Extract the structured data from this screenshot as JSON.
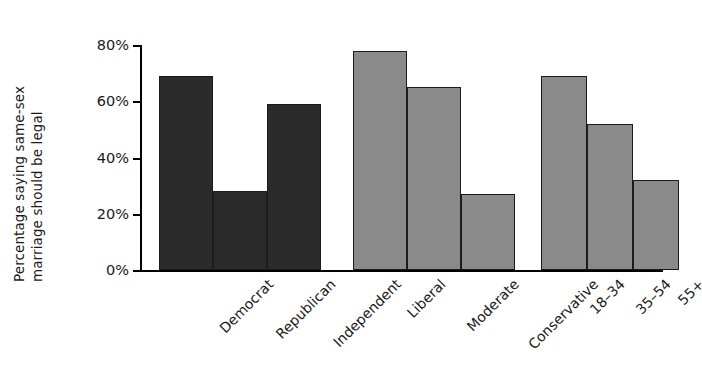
{
  "chart_data": {
    "type": "bar",
    "title": "",
    "subtitle": "",
    "xlabel": "",
    "ylabel": "Percentage saying same-sex marriage should be legal",
    "ylabel_line1": "Percentage saying same-sex",
    "ylabel_line2": "marriage should be legal",
    "ylim": [
      0,
      80
    ],
    "ytick_values": [
      0,
      20,
      40,
      60,
      80
    ],
    "ytick_labels": [
      "0%",
      "20%",
      "40%",
      "60%",
      "80%"
    ],
    "grid": false,
    "legend": false,
    "legend_position": "none",
    "categories": [
      "Democrat",
      "Republican",
      "Independent",
      "Liberal",
      "Moderate",
      "Conservative",
      "18–34",
      "35–54",
      "55+"
    ],
    "values": [
      69,
      28,
      59,
      78,
      65,
      27,
      69,
      52,
      32
    ],
    "groups": [
      {
        "name": "Party",
        "color": "#2b2b2b",
        "categories": [
          "Democrat",
          "Republican",
          "Independent"
        ],
        "values": [
          69,
          28,
          59
        ]
      },
      {
        "name": "Ideology",
        "color": "#8a8a8a",
        "categories": [
          "Liberal",
          "Moderate",
          "Conservative"
        ],
        "values": [
          78,
          65,
          27
        ]
      },
      {
        "name": "Age",
        "color": "#8a8a8a",
        "categories": [
          "18–34",
          "35–54",
          "55+"
        ],
        "values": [
          69,
          52,
          32
        ]
      }
    ],
    "bar_edge_color": "#1b1b1b",
    "axis_color": "#000000",
    "background_color": "#ffffff"
  },
  "bars": [
    {
      "label": "Democrat",
      "value": 69,
      "color": "#2b2b2b",
      "left": 18,
      "width": 54
    },
    {
      "label": "Republican",
      "value": 28,
      "color": "#2b2b2b",
      "left": 72,
      "width": 54
    },
    {
      "label": "Independent",
      "value": 59,
      "color": "#2b2b2b",
      "left": 126,
      "width": 54
    },
    {
      "label": "Liberal",
      "value": 78,
      "color": "#8a8a8a",
      "left": 212,
      "width": 54
    },
    {
      "label": "Moderate",
      "value": 65,
      "color": "#8a8a8a",
      "left": 266,
      "width": 54
    },
    {
      "label": "Conservative",
      "value": 27,
      "color": "#8a8a8a",
      "left": 320,
      "width": 54
    },
    {
      "label": "18–34",
      "value": 69,
      "color": "#8a8a8a",
      "left": 400,
      "width": 46
    },
    {
      "label": "35–54",
      "value": 52,
      "color": "#8a8a8a",
      "left": 446,
      "width": 46
    },
    {
      "label": "55+",
      "value": 32,
      "color": "#8a8a8a",
      "left": 492,
      "width": 46
    }
  ],
  "yticks": [
    {
      "label": "0%",
      "value": 0
    },
    {
      "label": "20%",
      "value": 20
    },
    {
      "label": "40%",
      "value": 40
    },
    {
      "label": "60%",
      "value": 60
    },
    {
      "label": "80%",
      "value": 80
    }
  ]
}
